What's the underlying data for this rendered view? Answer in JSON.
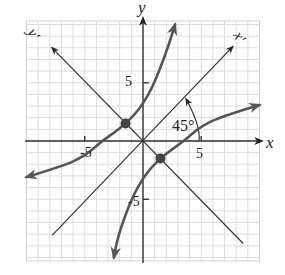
{
  "chart_data": {
    "type": "line",
    "title": "",
    "xlabel": "x",
    "ylabel": "y",
    "rotated_axes": {
      "x_prime_label": "x'",
      "y_prime_label": "y'",
      "rotation_label": "45°",
      "rotation_degrees": 45
    },
    "xlim": [
      -10,
      10
    ],
    "ylim": [
      -10.3,
      10.3
    ],
    "grid": true,
    "x_ticks": [
      {
        "value": -5,
        "label": "-5"
      },
      {
        "value": 5,
        "label": "5"
      }
    ],
    "y_ticks": [
      {
        "value": 5,
        "label": "5"
      },
      {
        "value": -5,
        "label": "-5"
      }
    ],
    "x_prime_axis": {
      "from": [
        -7.8,
        -8.1
      ],
      "to": [
        7.7,
        8.1
      ]
    },
    "y_prime_axis": {
      "from": [
        8.6,
        -8.8
      ],
      "to": [
        -7.8,
        8.0
      ]
    },
    "series": [
      {
        "name": "hyperbola-branch-upper",
        "points": [
          [
            -10,
            -3.1
          ],
          [
            -7,
            -2.2
          ],
          [
            -5,
            -1.3
          ],
          [
            -3.5,
            0
          ],
          [
            -2.5,
            0.7
          ],
          [
            -1.5,
            1.5
          ],
          [
            -0.7,
            2.3
          ],
          [
            0,
            3.2
          ],
          [
            0.8,
            4.6
          ],
          [
            1.5,
            6.3
          ],
          [
            2.2,
            8.2
          ],
          [
            2.75,
            10
          ]
        ]
      },
      {
        "name": "hyperbola-branch-lower",
        "points": [
          [
            10,
            3.1
          ],
          [
            7,
            2.2
          ],
          [
            5,
            1.3
          ],
          [
            3.5,
            0
          ],
          [
            2.5,
            -0.7
          ],
          [
            1.5,
            -1.5
          ],
          [
            0.7,
            -2.3
          ],
          [
            0,
            -3.2
          ],
          [
            -0.8,
            -4.6
          ],
          [
            -1.5,
            -6.3
          ],
          [
            -2.2,
            -8.4
          ],
          [
            -2.5,
            -10
          ]
        ]
      }
    ],
    "vertices": [
      [
        -1.5,
        1.5
      ],
      [
        1.5,
        -1.5
      ]
    ]
  }
}
